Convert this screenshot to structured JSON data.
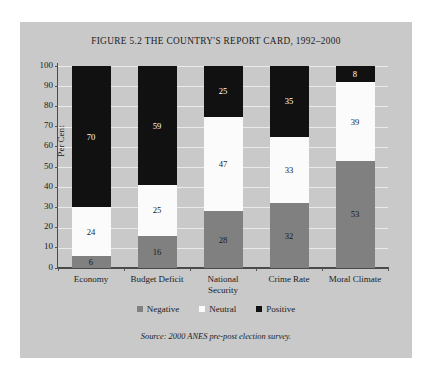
{
  "figure": {
    "title": "FIGURE 5.2 THE COUNTRY'S REPORT CARD, 1992–2000",
    "source_note": "Source: 2000 ANES pre-post election survey.",
    "panel_background": "#c9c9c9",
    "page_background": "#ffffff"
  },
  "chart_data": {
    "type": "bar",
    "subtype": "stacked-bar-100",
    "title": "FIGURE 5.2 THE COUNTRY'S REPORT CARD, 1992–2000",
    "xlabel": "",
    "ylabel": "Per Cent",
    "ylim": [
      0,
      100
    ],
    "ytick_step": 10,
    "yticks": [
      0,
      10,
      20,
      30,
      40,
      50,
      60,
      70,
      80,
      90,
      100
    ],
    "grid": true,
    "legend_position": "bottom",
    "categories": [
      "Economy",
      "Budget Deficit",
      "National Security",
      "Crime Rate",
      "Moral Climate"
    ],
    "category_label_lines": [
      [
        "Economy"
      ],
      [
        "Budget Deficit"
      ],
      [
        "National",
        "Security"
      ],
      [
        "Crime Rate"
      ],
      [
        "Moral Climate"
      ]
    ],
    "series": [
      {
        "name": "Negative",
        "color": "#808080",
        "text_color": "#1b1b1b",
        "values": [
          6,
          16,
          28,
          32,
          53
        ]
      },
      {
        "name": "Neutral",
        "color": "#fbfbfb",
        "text_color": "#1b1b1b",
        "values": [
          24,
          25,
          47,
          33,
          39
        ]
      },
      {
        "name": "Positive",
        "color": "#111111",
        "text_color": "#ffffff",
        "values": [
          70,
          59,
          25,
          35,
          8
        ]
      }
    ],
    "stack_order_bottom_to_top": [
      "Negative",
      "Neutral",
      "Positive"
    ],
    "annotations": [
      {
        "category": "Economy",
        "Negative": 6,
        "Neutral": 24,
        "Positive": 70
      },
      {
        "category": "Budget Deficit",
        "Negative": 16,
        "Neutral": 25,
        "Positive": 59
      },
      {
        "category": "National Security",
        "Negative": 28,
        "Neutral": 47,
        "Positive": 25
      },
      {
        "category": "Crime Rate",
        "Negative": 32,
        "Neutral": 33,
        "Positive": 35
      },
      {
        "category": "Moral Climate",
        "Negative": 53,
        "Neutral": 39,
        "Positive": 8
      }
    ]
  },
  "legend": {
    "items": [
      {
        "label": "Negative",
        "color": "#808080"
      },
      {
        "label": "Neutral",
        "color": "#fbfbfb"
      },
      {
        "label": "Positive",
        "color": "#111111"
      }
    ]
  }
}
